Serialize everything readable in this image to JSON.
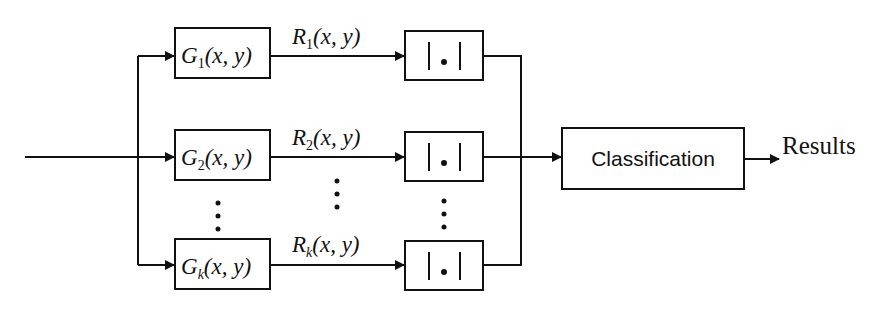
{
  "diagram": {
    "input_label": "",
    "filters": [
      {
        "name": "G",
        "sub": "1",
        "args": "(x, y)",
        "response": {
          "name": "R",
          "sub": "1",
          "args": "(x, y)"
        }
      },
      {
        "name": "G",
        "sub": "2",
        "args": "(x, y)",
        "response": {
          "name": "R",
          "sub": "2",
          "args": "(x, y)"
        }
      },
      {
        "name": "G",
        "sub": "k",
        "args": "(x, y)",
        "response": {
          "name": "R",
          "sub": "k",
          "args": "(x, y)"
        }
      }
    ],
    "abs_op": {
      "left_bar": "|",
      "dot": "•",
      "right_bar": "|"
    },
    "ellipsis": "⋮",
    "classifier": {
      "label": "Classification"
    },
    "output": {
      "label": "Results"
    }
  },
  "colors": {
    "stroke": "#111111",
    "background": "#ffffff"
  }
}
